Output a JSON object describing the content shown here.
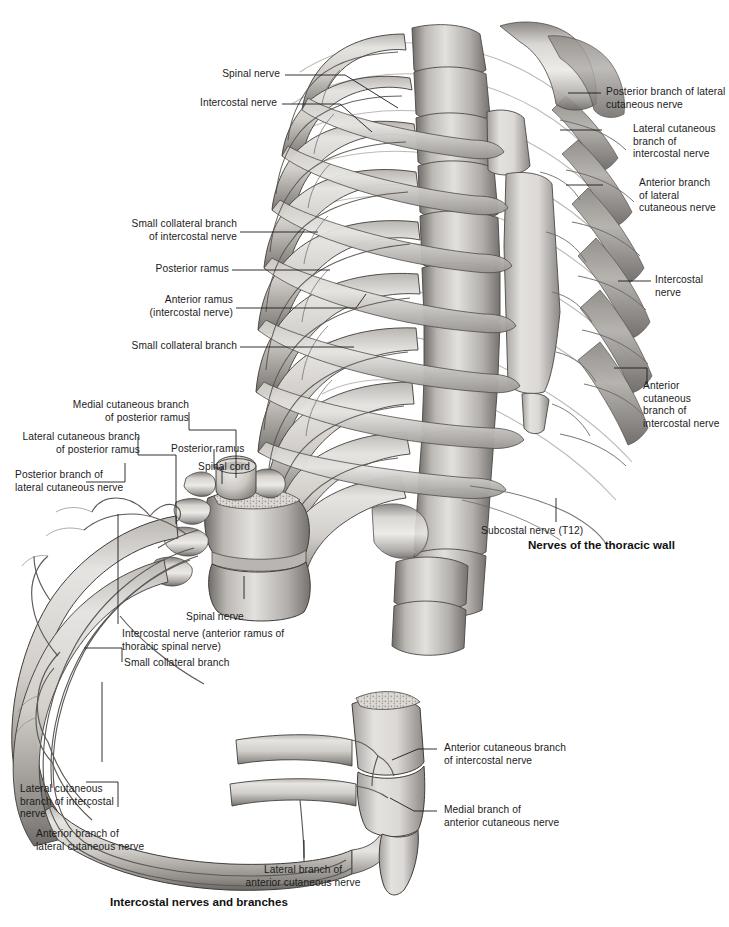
{
  "page": {
    "background_color": "#ffffff",
    "text_color": "#1b1b1b",
    "width": 729,
    "height": 927
  },
  "figures": [
    {
      "id": "thoracic-wall",
      "caption": "Nerves of the thoracic wall",
      "caption_pos": {
        "x": 528,
        "y": 538
      }
    },
    {
      "id": "intercostal-nerves",
      "caption": "Intercostal nerves and branches",
      "caption_pos": {
        "x": 110,
        "y": 896
      }
    }
  ],
  "labels_top_figure": {
    "spinal_nerve": "Spinal nerve",
    "intercostal_nerve_left": "Intercostal nerve",
    "small_collateral_branch_of_intercostal_nerve": "Small collateral branch\nof intercostal nerve",
    "posterior_ramus": "Posterior ramus",
    "anterior_ramus_intercostal_nerve": "Anterior ramus\n(intercostal nerve)",
    "small_collateral_branch": "Small collateral branch",
    "posterior_branch_of_lateral_cutaneous_nerve": "Posterior branch of lateral\ncutaneous nerve",
    "lateral_cutaneous_branch_of_intercostal_nerve": "Lateral cutaneous\nbranch of\nintercostal nerve",
    "anterior_branch_of_lateral_cutaneous_nerve": "Anterior branch\nof lateral\ncutaneous nerve",
    "intercostal_nerve_right": "Intercostal\nnerve",
    "anterior_cutaneous_branch_of_intercostal_nerve": "Anterior\ncutaneous\nbranch of\nintercostal nerve",
    "subcostal_nerve_t12": "Subcostal nerve (T12)"
  },
  "labels_bottom_figure": {
    "medial_cutaneous_branch_of_posterior_ramus": "Medial cutaneous branch\nof posterior ramus",
    "lateral_cutaneous_branch_of_posterior_ramus": "Lateral cutaneous branch\nof posterior ramus",
    "posterior_branch_of_lateral_cutaneous_nerve": "Posterior branch of\nlateral cutaneous nerve",
    "posterior_ramus": "Posterior ramus",
    "spinal_cord": "Spinal cord",
    "spinal_nerve": "Spinal nerve",
    "intercostal_nerve_anterior_ramus": "Intercostal nerve (anterior ramus of\nthoracic spinal nerve)",
    "small_collateral_branch": "Small collateral branch",
    "lateral_cutaneous_branch_of_intercostal_nerve": "Lateral cutaneous\nbranch of intercostal\nnerve",
    "anterior_branch_of_lateral_cutaneous_nerve": "Anterior branch of\nlateral cutaneous nerve",
    "lateral_branch_of_anterior_cutaneous_nerve": "Lateral branch of\nanterior cutaneous nerve",
    "anterior_cutaneous_branch_of_intercostal_nerve": "Anterior cutaneous branch\nof intercostal nerve",
    "medial_branch_of_anterior_cutaneous_nerve": "Medial branch of\nanterior cutaneous nerve"
  },
  "colors": {
    "bone_light": "#e9e7e4",
    "bone_mid": "#cfccc8",
    "bone_dark": "#9b9893",
    "bone_shadow": "#6f6d6a",
    "outline": "#3a3a3a",
    "nerve_line": "#8d8b88",
    "leader_line": "#1b1b1b"
  }
}
